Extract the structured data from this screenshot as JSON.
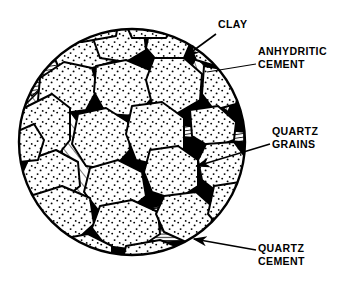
{
  "figure": {
    "type": "geological-thin-section-diagram",
    "shape": "circle",
    "circle": {
      "cx": 132,
      "cy": 142,
      "r": 114
    },
    "colors": {
      "ink": "#000000",
      "background": "#ffffff",
      "grain_fill": "#ffffff",
      "clay_fill": "#000000",
      "hatch_stroke": "#000000"
    }
  },
  "labels": [
    {
      "id": "clay",
      "text": "CLAY",
      "leader": {
        "from_x": 216,
        "from_y": 34,
        "to_x": 185,
        "to_y": 56,
        "arrow": true
      }
    },
    {
      "id": "anhydritic_cement",
      "text": "ANHYDRITIC\nCEMENT",
      "leader": {
        "from_x": 256,
        "from_y": 64,
        "to_x": 208,
        "to_y": 72,
        "arrow": false
      }
    },
    {
      "id": "quartz_grains",
      "text": "QUARTZ\nGRAINS",
      "leader": {
        "from_x": 270,
        "from_y": 144,
        "to_x": 196,
        "to_y": 166,
        "arrow": true
      }
    },
    {
      "id": "quartz_cement",
      "text": "QUARTZ\nCEMENT",
      "leader": {
        "from_x": 256,
        "from_y": 250,
        "to_x": 193,
        "to_y": 239,
        "arrow": true
      }
    }
  ],
  "legend_semantics": {
    "quartz_grains": "white polygons with stipple dots",
    "clay": "solid black angular wedges between grains",
    "anhydritic_cement": "coarse diagonal hatching bands",
    "quartz_cement": "fine closely spaced horizontal hatching"
  }
}
